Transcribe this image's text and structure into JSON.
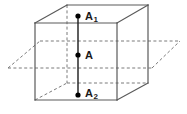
{
  "figure": {
    "kind": "geometry-diagram",
    "background_color": "#ffffff",
    "solid_edge_color": "#555555",
    "hidden_edge_color": "#777777",
    "segment_color": "#1a1a1a",
    "point_color": "#000000",
    "label_color": "#1a1a1a",
    "labels": {
      "top": {
        "base": "A",
        "sub": "1"
      },
      "middle": {
        "base": "A",
        "sub": ""
      },
      "bottom": {
        "base": "A",
        "sub": "2"
      }
    },
    "points": [
      {
        "name": "A1",
        "x": 78,
        "y": 16
      },
      {
        "name": "A",
        "x": 78,
        "y": 55
      },
      {
        "name": "A2",
        "x": 78,
        "y": 95
      }
    ],
    "cube": {
      "front_top_left": {
        "x": 35,
        "y": 23
      },
      "front_top_right": {
        "x": 117,
        "y": 23
      },
      "front_bottom_left": {
        "x": 35,
        "y": 100
      },
      "front_bottom_right": {
        "x": 117,
        "y": 100
      },
      "back_top_left": {
        "x": 67,
        "y": 5
      },
      "back_top_right": {
        "x": 148,
        "y": 5
      },
      "back_bottom_left": {
        "x": 67,
        "y": 83
      },
      "back_bottom_right": {
        "x": 148,
        "y": 83
      }
    },
    "plane": {
      "left_edge_x": 8,
      "right_edge_x": 180,
      "front_y": 68,
      "back_y": 41
    },
    "segment": {
      "x": 78,
      "y_top": 16,
      "y_bottom": 95
    }
  }
}
